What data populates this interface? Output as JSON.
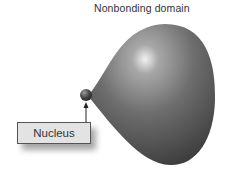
{
  "title": "Nonbonding domain",
  "labels": {
    "nucleus": "Nucleus"
  },
  "colors": {
    "domain_dark": "#3a3a3a",
    "domain_mid": "#6e6e6e",
    "domain_highlight": "#e8e8e8",
    "nucleus": "#505050",
    "label_bg": "#e3e3e3"
  }
}
